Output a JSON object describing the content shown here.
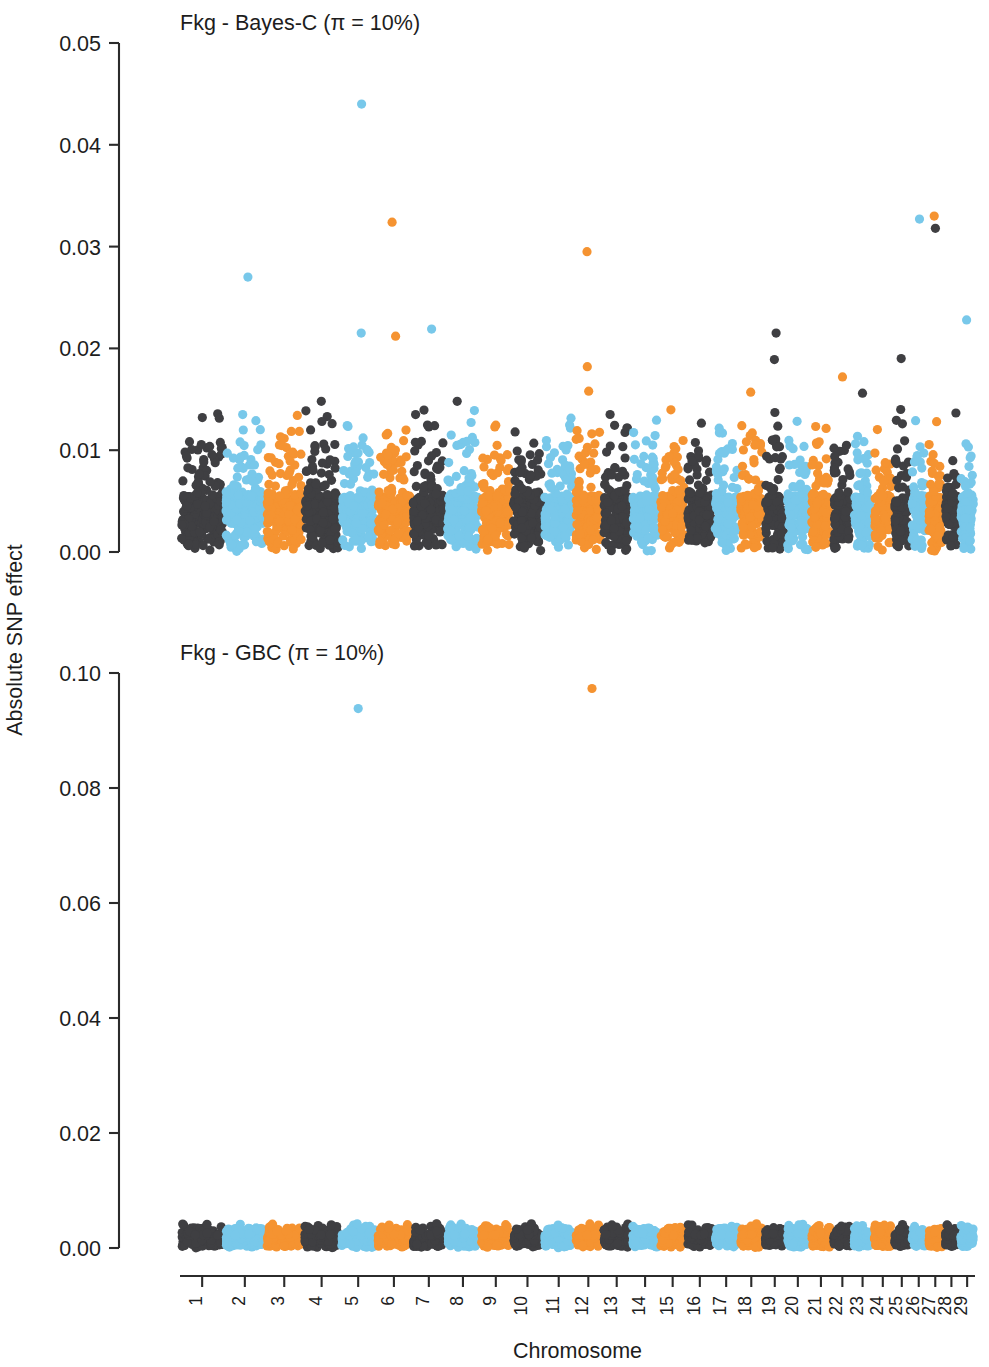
{
  "figure": {
    "y_axis_title": "Absolute SNP effect",
    "x_axis_title": "Chromosome"
  },
  "panels": [
    {
      "id": "bayesc",
      "title": "Fkg - Bayes-C (π = 10%)",
      "y_ticks": [
        "0.00",
        "0.01",
        "0.02",
        "0.03",
        "0.04",
        "0.05"
      ],
      "y_tick_values": [
        0.0,
        0.01,
        0.02,
        0.03,
        0.04,
        0.05
      ],
      "ylim": [
        0,
        0.05
      ]
    },
    {
      "id": "gbc",
      "title": "Fkg - GBC (π = 10%)",
      "y_ticks": [
        "0.00",
        "0.02",
        "0.04",
        "0.06",
        "0.08",
        "0.10"
      ],
      "y_tick_values": [
        0.0,
        0.02,
        0.04,
        0.06,
        0.08,
        0.1
      ],
      "ylim": [
        0,
        0.1
      ]
    }
  ],
  "chromosomes": [
    "1",
    "2",
    "3",
    "4",
    "5",
    "6",
    "7",
    "8",
    "9",
    "10",
    "11",
    "12",
    "13",
    "14",
    "15",
    "16",
    "17",
    "18",
    "19",
    "20",
    "21",
    "22",
    "23",
    "24",
    "25",
    "26",
    "27",
    "28",
    "29"
  ],
  "colors": {
    "dark": "#3f3f42",
    "blue": "#78c8ea",
    "orange": "#f59331",
    "axis": "#2b2b2b",
    "background": "#ffffff"
  },
  "chart_data": {
    "type": "scatter",
    "xlabel": "Chromosome",
    "ylabel": "Absolute SNP effect",
    "grid": false,
    "legend": "none",
    "x_tick_labels": [
      "1",
      "2",
      "3",
      "4",
      "5",
      "6",
      "7",
      "8",
      "9",
      "10",
      "11",
      "12",
      "13",
      "14",
      "15",
      "16",
      "17",
      "18",
      "19",
      "20",
      "21",
      "22",
      "23",
      "24",
      "25",
      "26",
      "27",
      "28",
      "29"
    ],
    "chromosome_relative_widths": [
      1.0,
      0.92,
      0.84,
      0.82,
      0.8,
      0.78,
      0.76,
      0.74,
      0.7,
      0.68,
      0.68,
      0.6,
      0.62,
      0.6,
      0.58,
      0.58,
      0.54,
      0.52,
      0.46,
      0.5,
      0.46,
      0.42,
      0.4,
      0.42,
      0.34,
      0.32,
      0.32,
      0.3,
      0.3
    ],
    "color_cycle": [
      "dark",
      "blue",
      "orange"
    ],
    "panels": [
      {
        "name": "Fkg - Bayes-C (π = 10%)",
        "ylim": [
          0,
          0.05
        ],
        "y_ticks": [
          0.0,
          0.01,
          0.02,
          0.03,
          0.04,
          0.05
        ],
        "baseline_band_top": 0.0055,
        "typical_bulk_max": 0.011,
        "notable_points": [
          {
            "chromosome": 5,
            "value": 0.044,
            "color": "blue"
          },
          {
            "chromosome": 2,
            "value": 0.027,
            "color": "blue"
          },
          {
            "chromosome": 6,
            "value": 0.0324,
            "color": "orange"
          },
          {
            "chromosome": 12,
            "value": 0.0295,
            "color": "orange"
          },
          {
            "chromosome": 26,
            "value": 0.0327,
            "color": "blue"
          },
          {
            "chromosome": 27,
            "value": 0.033,
            "color": "orange"
          },
          {
            "chromosome": 27,
            "value": 0.0318,
            "color": "dark"
          },
          {
            "chromosome": 5,
            "value": 0.0215,
            "color": "blue"
          },
          {
            "chromosome": 6,
            "value": 0.0212,
            "color": "orange"
          },
          {
            "chromosome": 7,
            "value": 0.0219,
            "color": "blue"
          },
          {
            "chromosome": 19,
            "value": 0.0215,
            "color": "dark"
          },
          {
            "chromosome": 29,
            "value": 0.0228,
            "color": "blue"
          },
          {
            "chromosome": 12,
            "value": 0.0182,
            "color": "orange"
          },
          {
            "chromosome": 25,
            "value": 0.019,
            "color": "dark"
          },
          {
            "chromosome": 19,
            "value": 0.0189,
            "color": "dark"
          },
          {
            "chromosome": 22,
            "value": 0.0172,
            "color": "orange"
          },
          {
            "chromosome": 12,
            "value": 0.0158,
            "color": "orange"
          },
          {
            "chromosome": 18,
            "value": 0.0157,
            "color": "orange"
          },
          {
            "chromosome": 23,
            "value": 0.0156,
            "color": "dark"
          },
          {
            "chromosome": 4,
            "value": 0.0148,
            "color": "dark"
          },
          {
            "chromosome": 8,
            "value": 0.0148,
            "color": "dark"
          },
          {
            "chromosome": 1,
            "value": 0.0132,
            "color": "dark"
          },
          {
            "chromosome": 2,
            "value": 0.0135,
            "color": "blue"
          },
          {
            "chromosome": 19,
            "value": 0.0137,
            "color": "dark"
          },
          {
            "chromosome": 25,
            "value": 0.014,
            "color": "dark"
          },
          {
            "chromosome": 27,
            "value": 0.0128,
            "color": "orange"
          }
        ]
      },
      {
        "name": "Fkg - GBC (π = 10%)",
        "ylim": [
          0,
          0.1
        ],
        "y_ticks": [
          0.0,
          0.02,
          0.04,
          0.06,
          0.08,
          0.1
        ],
        "baseline_band_top": 0.0022,
        "typical_bulk_max": 0.0035,
        "notable_points": [
          {
            "chromosome": 5,
            "value": 0.0938,
            "color": "blue"
          },
          {
            "chromosome": 12,
            "value": 0.0973,
            "color": "orange"
          },
          {
            "chromosome": 22,
            "value": 0.0038,
            "color": "dark"
          },
          {
            "chromosome": 5,
            "value": 0.0042,
            "color": "blue"
          },
          {
            "chromosome": 11,
            "value": 0.004,
            "color": "blue"
          }
        ]
      }
    ]
  }
}
